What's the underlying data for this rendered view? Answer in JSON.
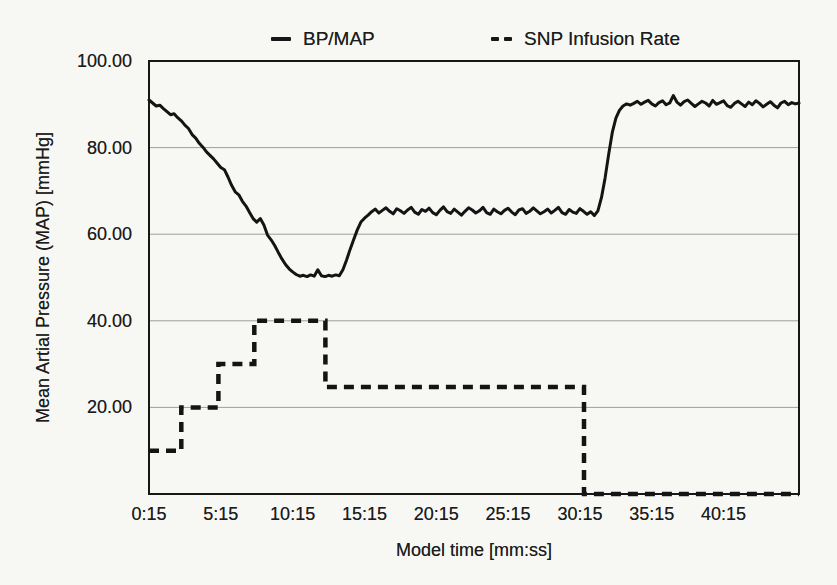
{
  "figure": {
    "background_color": "#f7f7f4",
    "ink_color": "#171717",
    "grid_color": "#9d9d9d"
  },
  "legend": {
    "position": "top",
    "items": [
      {
        "label": "BP/MAP",
        "marker": "solid-line"
      },
      {
        "label": "SNP Infusion Rate",
        "marker": "dashed-line"
      }
    ]
  },
  "chart_data": {
    "type": "line",
    "title": "",
    "xlabel": "Model time [mm:ss]",
    "ylabel": "Mean Artial Pressure (MAP) [mmHg]",
    "xlim_seconds": [
      15,
      2730
    ],
    "ylim": [
      0,
      100
    ],
    "grid": "horizontal",
    "y_gridlines": [
      20,
      40,
      60,
      80
    ],
    "y_ticks": [
      {
        "value": 20,
        "label": "20.00"
      },
      {
        "value": 40,
        "label": "40.00"
      },
      {
        "value": 60,
        "label": "60.00"
      },
      {
        "value": 80,
        "label": "80.00"
      },
      {
        "value": 100,
        "label": "100.00"
      }
    ],
    "x_ticks": [
      {
        "seconds": 15,
        "label": "0:15"
      },
      {
        "seconds": 315,
        "label": "5:15"
      },
      {
        "seconds": 615,
        "label": "10:15"
      },
      {
        "seconds": 915,
        "label": "15:15"
      },
      {
        "seconds": 1215,
        "label": "20:15"
      },
      {
        "seconds": 1515,
        "label": "25:15"
      },
      {
        "seconds": 1815,
        "label": "30:15"
      },
      {
        "seconds": 2115,
        "label": "35:15"
      },
      {
        "seconds": 2415,
        "label": "40:15"
      }
    ],
    "legend_position": "top",
    "series": [
      {
        "name": "BP/MAP",
        "line_style": "solid",
        "units": "mmHg",
        "sampling": {
          "t0_seconds": 15,
          "dt_seconds": 15
        },
        "values": [
          91.0,
          90.3,
          89.6,
          89.8,
          89.0,
          88.3,
          87.6,
          87.8,
          86.9,
          86.2,
          85.2,
          84.4,
          83.0,
          82.2,
          81.0,
          80.1,
          79.0,
          78.2,
          77.4,
          76.4,
          75.4,
          74.9,
          73.2,
          71.3,
          69.8,
          69.1,
          67.6,
          66.5,
          65.0,
          63.6,
          62.8,
          63.6,
          62.1,
          59.8,
          58.7,
          57.4,
          55.8,
          54.3,
          53.0,
          52.0,
          51.3,
          50.7,
          50.3,
          50.5,
          50.2,
          50.6,
          50.3,
          51.8,
          50.4,
          50.2,
          50.5,
          50.3,
          50.6,
          50.4,
          51.8,
          54.0,
          56.5,
          58.8,
          61.0,
          62.8,
          63.7,
          64.4,
          65.2,
          65.8,
          64.9,
          65.5,
          66.1,
          65.3,
          64.7,
          65.9,
          65.4,
          64.8,
          65.6,
          66.2,
          65.1,
          64.6,
          65.7,
          65.3,
          66.0,
          65.0,
          64.5,
          65.5,
          66.3,
          65.2,
          64.8,
          65.8,
          65.1,
          64.4,
          65.3,
          66.1,
          65.6,
          64.9,
          65.4,
          66.2,
          65.0,
          64.6,
          65.8,
          65.2,
          64.7,
          65.5,
          66.0,
          65.1,
          64.5,
          65.6,
          65.9,
          64.8,
          65.3,
          66.1,
          65.4,
          64.7,
          65.2,
          65.8,
          64.9,
          65.5,
          66.2,
          65.0,
          64.6,
          65.7,
          65.1,
          64.8,
          65.9,
          65.3,
          64.6,
          65.2,
          64.3,
          65.4,
          68.5,
          73.0,
          78.5,
          83.5,
          86.8,
          88.6,
          89.6,
          90.1,
          89.8,
          90.2,
          90.7,
          90.0,
          90.5,
          90.9,
          90.1,
          89.6,
          90.4,
          90.8,
          89.9,
          90.3,
          92.0,
          90.5,
          89.8,
          90.6,
          91.0,
          90.2,
          89.5,
          90.1,
          90.7,
          90.3,
          89.6,
          90.9,
          90.0,
          90.4,
          90.8,
          89.7,
          89.3,
          90.2,
          90.7,
          90.1,
          89.5,
          90.5,
          89.9,
          90.8,
          90.2,
          89.4,
          90.0,
          90.6,
          89.8,
          89.2,
          90.3,
          90.7,
          89.9,
          90.4,
          90.1,
          90.3
        ]
      },
      {
        "name": "SNP Infusion Rate",
        "line_style": "dashed",
        "points_seconds": [
          [
            15,
            10
          ],
          [
            150,
            10
          ],
          [
            150,
            20
          ],
          [
            305,
            20
          ],
          [
            305,
            30
          ],
          [
            455,
            30
          ],
          [
            455,
            40
          ],
          [
            752,
            40
          ],
          [
            752,
            24.7
          ],
          [
            1832,
            24.7
          ],
          [
            1832,
            0
          ],
          [
            2730,
            0
          ]
        ]
      }
    ]
  }
}
